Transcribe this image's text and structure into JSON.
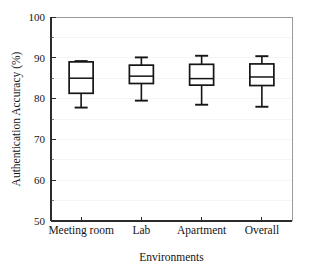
{
  "chart_data": {
    "type": "box",
    "title": "",
    "xlabel": "Environments",
    "ylabel": "Authentication Accuracy (%)",
    "categories": [
      "Meeting room",
      "Lab",
      "Apartment",
      "Overall"
    ],
    "ylim": [
      50,
      100
    ],
    "ytick_labels": [
      "50",
      "60",
      "70",
      "80",
      "90",
      "100"
    ],
    "ytick_values": [
      50,
      60,
      70,
      80,
      90,
      100
    ],
    "yminor_values": [
      55,
      65,
      75,
      85,
      95
    ],
    "grid": true,
    "legend": "none",
    "boxes": [
      {
        "category": "Meeting room",
        "whisker_low": 77.8,
        "q1": 81.3,
        "median": 85.0,
        "q3": 89.0,
        "whisker_high": 89.2
      },
      {
        "category": "Lab",
        "whisker_low": 79.5,
        "q1": 83.7,
        "median": 85.5,
        "q3": 88.2,
        "whisker_high": 90.1
      },
      {
        "category": "Apartment",
        "whisker_low": 78.5,
        "q1": 83.3,
        "median": 84.9,
        "q3": 88.4,
        "whisker_high": 90.5
      },
      {
        "category": "Overall",
        "whisker_low": 78.0,
        "q1": 83.2,
        "median": 85.3,
        "q3": 88.5,
        "whisker_high": 90.4
      }
    ],
    "colors": {
      "box_stroke": "#151515",
      "box_fill": "#ffffff",
      "axis": "#2b2b2b",
      "grid": "#f2f2f2",
      "background": "#ffffff"
    }
  }
}
